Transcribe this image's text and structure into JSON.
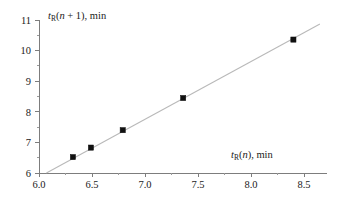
{
  "chart_data": {
    "type": "scatter",
    "title": "",
    "xlabel": "tR(n), min",
    "ylabel": "tR(n + 1), min",
    "xlabel_parts": {
      "var": "t",
      "sub": "R",
      "rest": "(n + 1), min",
      "rest_x": "(n), min"
    },
    "x": [
      6.32,
      6.49,
      6.79,
      7.36,
      8.4
    ],
    "y": [
      6.52,
      6.83,
      7.4,
      8.45,
      10.36
    ],
    "points": [
      {
        "x": 6.32,
        "y": 6.52
      },
      {
        "x": 6.49,
        "y": 6.83
      },
      {
        "x": 6.79,
        "y": 7.4
      },
      {
        "x": 7.36,
        "y": 8.45
      },
      {
        "x": 8.4,
        "y": 10.36
      }
    ],
    "xlim": [
      6.0,
      8.72
    ],
    "ylim": [
      6.0,
      11.0
    ],
    "xticks": [
      6.0,
      6.5,
      7.0,
      7.5,
      8.0,
      8.5
    ],
    "xticklabels": [
      "6.0",
      "6.5",
      "7.0",
      "7.5",
      "8.0",
      "8.5"
    ],
    "yticks": [
      6,
      7,
      8,
      9,
      10,
      11
    ],
    "yticklabels": [
      "6",
      "7",
      "8",
      "9",
      "10",
      "11"
    ],
    "x_minor_ticks": [
      6.25,
      6.75,
      7.25,
      7.75,
      8.25
    ],
    "y_minor_ticks": [
      6.5,
      7.5,
      8.5,
      9.5,
      10.5
    ],
    "grid": false,
    "legend": null,
    "trendline": {
      "label": "linear fit",
      "x_start": 6.07,
      "y_start": 6.0,
      "x_end": 8.65,
      "y_end": 10.87,
      "color": "#b9b9b9"
    },
    "marker_style": "filled-square",
    "marker_color": "#111111",
    "axis_color": "#7d7d7d",
    "background": "#ffffff"
  }
}
